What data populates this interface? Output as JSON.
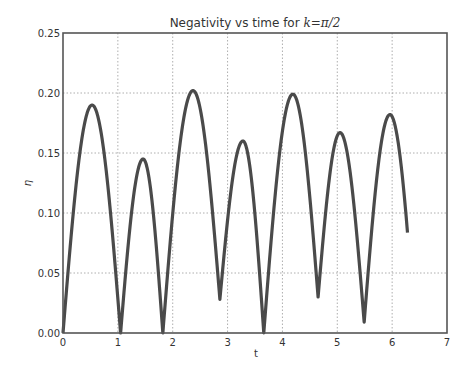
{
  "chart_data": {
    "type": "line",
    "title": "Negativity vs time for k=π/2",
    "title_prefix": "Negativity vs time for ",
    "title_math": "k=π/2",
    "xlabel": "t",
    "ylabel": "η",
    "xlim": [
      0,
      7
    ],
    "ylim": [
      0,
      0.25
    ],
    "xticks": [
      "0",
      "1",
      "2",
      "3",
      "4",
      "5",
      "6",
      "7"
    ],
    "yticks": [
      "0.00",
      "0.05",
      "0.10",
      "0.15",
      "0.20",
      "0.25"
    ],
    "grid": true,
    "legend": null,
    "line_color": "#4a4a4a",
    "series": [
      {
        "name": "η(t)",
        "x": [
          0,
          0.53,
          1.05,
          1.46,
          1.82,
          2.37,
          2.86,
          3.28,
          3.66,
          4.19,
          4.65,
          5.05,
          5.49,
          5.96,
          6.28
        ],
        "y": [
          0.0,
          0.19,
          0.0,
          0.145,
          0.0,
          0.202,
          0.028,
          0.16,
          0.0,
          0.199,
          0.03,
          0.167,
          0.009,
          0.182,
          0.105
        ],
        "point_types": [
          "min",
          "max",
          "min",
          "max",
          "min",
          "max",
          "min",
          "max",
          "min",
          "max",
          "min",
          "max",
          "min",
          "max",
          "end"
        ]
      }
    ]
  }
}
